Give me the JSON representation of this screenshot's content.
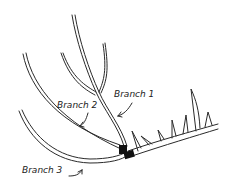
{
  "diagram": {
    "type": "plant-pruning-illustration",
    "labels": {
      "branch1": "Branch 1",
      "branch2": "Branch 2",
      "branch3": "Branch 3"
    },
    "colors": {
      "line": "#2a2a2a",
      "tie": "#111111",
      "background": "#ffffff"
    }
  }
}
